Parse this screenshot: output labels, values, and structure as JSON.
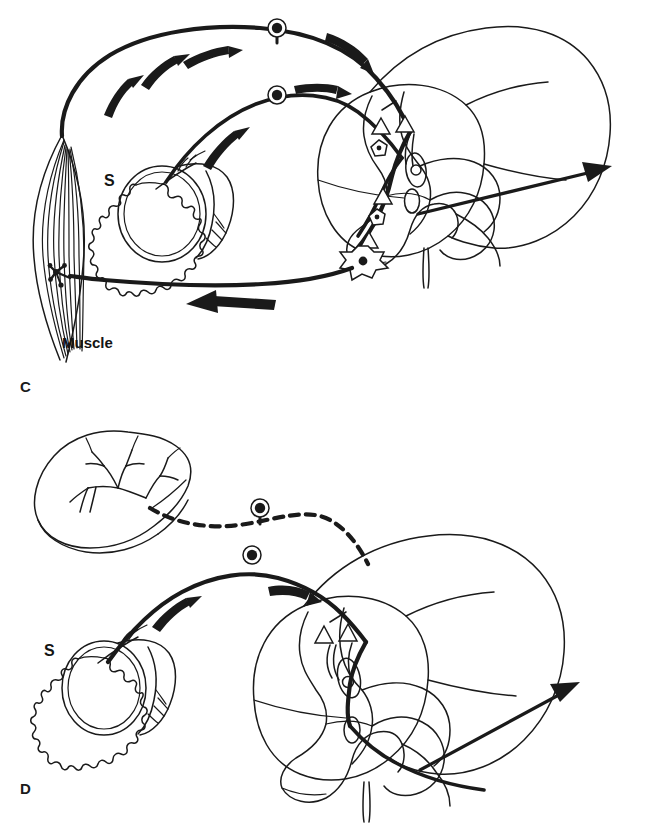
{
  "figure": {
    "background_color": "#ffffff",
    "ink_color": "#1a1a1a",
    "width": 651,
    "height": 825
  },
  "panels": [
    {
      "id": "C",
      "letter": "C",
      "caption_position": "bottom-left",
      "description": "Somatic reflex arc: muscle spindle and skin afferents enter dorsal horn, motor neuron returns to muscle",
      "labels": [
        {
          "name": "skin-label",
          "text": "S",
          "x": 107,
          "y": 181
        },
        {
          "name": "muscle-label",
          "text": "Muscle",
          "x": 62,
          "y": 345
        }
      ],
      "structures": [
        "muscle",
        "skin-block",
        "dorsal-root-ganglion-upper",
        "dorsal-root-ganglion-lower",
        "spinal-cord",
        "gray-matter",
        "central-canal",
        "dorsal-horn-interneurons",
        "motor-neuron",
        "motor-end-plate",
        "ascending-tract-arrow"
      ],
      "flow_arrows": [
        {
          "name": "afferent-arrow-skin-1",
          "direction": "toward-cord"
        },
        {
          "name": "afferent-arrow-skin-2",
          "direction": "toward-cord"
        },
        {
          "name": "afferent-arrow-skin-3",
          "direction": "toward-cord"
        },
        {
          "name": "afferent-arrow-spindle-1",
          "direction": "toward-cord"
        },
        {
          "name": "afferent-arrow-spindle-2",
          "direction": "toward-cord"
        },
        {
          "name": "efferent-arrow-motor",
          "direction": "toward-muscle"
        }
      ]
    },
    {
      "id": "D",
      "letter": "D",
      "caption_position": "bottom-left",
      "description": "Visceral afferent (dashed) from organ converges with somatic skin afferent (solid) on same dorsal horn projection neuron",
      "labels": [
        {
          "name": "skin-label",
          "text": "S",
          "x": 48,
          "y": 651
        }
      ],
      "structures": [
        "visceral-organ",
        "skin-block",
        "dorsal-root-ganglion-visceral",
        "dorsal-root-ganglion-somatic",
        "spinal-cord",
        "gray-matter",
        "central-canal",
        "projection-neuron",
        "convergent-synapses",
        "ascending-tract-arrow"
      ],
      "flow_arrows": [
        {
          "name": "afferent-arrow-skin-1",
          "direction": "toward-cord"
        },
        {
          "name": "afferent-arrow-skin-2",
          "direction": "toward-cord"
        }
      ],
      "pathway_styles": {
        "visceral": "dashed",
        "somatic": "solid"
      }
    }
  ]
}
